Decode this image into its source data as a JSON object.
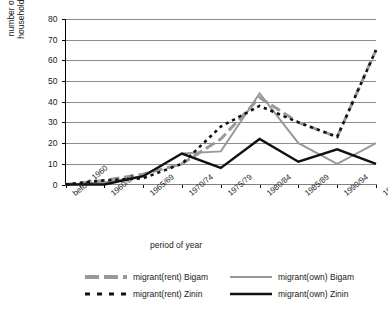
{
  "chart_data": {
    "type": "line",
    "title": "",
    "xlabel": "period of year",
    "ylabel": "number of households",
    "ylim": [
      0,
      80
    ],
    "ytick_values": [
      0,
      10,
      20,
      30,
      40,
      50,
      60,
      70,
      80
    ],
    "grid": "horizontal",
    "legend_position": "bottom",
    "categories": [
      "before 1960",
      "1960/64",
      "1965/69",
      "1970/74",
      "1975/79",
      "1980/84",
      "1985/89",
      "1990/94",
      "1995/2003"
    ],
    "series": [
      {
        "name": "migrant(rent) Bigam",
        "color": "#999999",
        "style": "dashed",
        "width": 3,
        "values": [
          0,
          2,
          5,
          10,
          22,
          42,
          30,
          23,
          65
        ]
      },
      {
        "name": "migrant(own) Bigam",
        "color": "#999999",
        "style": "solid",
        "width": 2,
        "values": [
          0,
          1,
          4,
          15,
          16,
          44,
          20,
          10,
          20
        ]
      },
      {
        "name": "migrant(rent) Zinin",
        "color": "#111111",
        "style": "dotted",
        "width": 2.6,
        "values": [
          0,
          2,
          3,
          10,
          28,
          38,
          30,
          23,
          65
        ]
      },
      {
        "name": "migrant(own) Zinin",
        "color": "#111111",
        "style": "solid",
        "width": 2.4,
        "values": [
          0,
          0,
          4,
          15,
          8,
          22,
          11,
          17,
          10
        ]
      }
    ]
  },
  "legend": {
    "items": [
      {
        "label": "migrant(rent) Bigam",
        "key": "gray-dashed-key"
      },
      {
        "label": "migrant(own) Bigam",
        "key": "gray-solid-key"
      },
      {
        "label": "migrant(rent) Zinin",
        "key": "black-dotted-key"
      },
      {
        "label": "migrant(own) Zinin",
        "key": "black-solid-key"
      }
    ]
  },
  "axes": {
    "y_title_line1": "number of",
    "y_title_line2": "households",
    "x_title": "period of year"
  }
}
